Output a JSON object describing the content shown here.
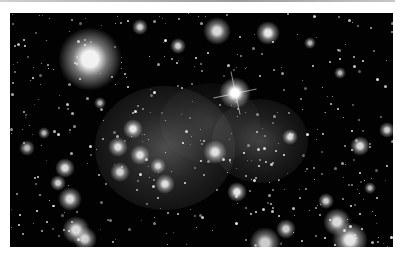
{
  "image": {
    "subject": "deep-field astronomical photograph of a galaxy cluster with diffuse intracluster light",
    "palette": {
      "background": "#020202",
      "page": "#ffffff",
      "rule": "#9a9a9a"
    },
    "glows": [
      {
        "x": 155,
        "y": 135,
        "rx": 70,
        "ry": 62,
        "a": 0.38
      },
      {
        "x": 250,
        "y": 128,
        "rx": 48,
        "ry": 42,
        "a": 0.32
      },
      {
        "x": 200,
        "y": 110,
        "rx": 50,
        "ry": 40,
        "a": 0.18
      }
    ],
    "bright_objects": [
      {
        "x": 80,
        "y": 46,
        "r": 16,
        "a": 0.95
      },
      {
        "x": 225,
        "y": 80,
        "r": 8,
        "a": 1.0,
        "spikes": true
      },
      {
        "x": 207,
        "y": 18,
        "r": 7,
        "a": 0.85
      },
      {
        "x": 258,
        "y": 20,
        "r": 6,
        "a": 0.9
      },
      {
        "x": 168,
        "y": 33,
        "r": 4,
        "a": 0.8
      },
      {
        "x": 130,
        "y": 14,
        "r": 4,
        "a": 0.8
      },
      {
        "x": 205,
        "y": 139,
        "r": 6,
        "a": 0.85
      },
      {
        "x": 123,
        "y": 116,
        "r": 5,
        "a": 0.9
      },
      {
        "x": 130,
        "y": 142,
        "r": 5,
        "a": 0.85
      },
      {
        "x": 108,
        "y": 134,
        "r": 5,
        "a": 0.85
      },
      {
        "x": 148,
        "y": 153,
        "r": 4,
        "a": 0.8
      },
      {
        "x": 155,
        "y": 171,
        "r": 5,
        "a": 0.85
      },
      {
        "x": 110,
        "y": 159,
        "r": 5,
        "a": 0.8
      },
      {
        "x": 55,
        "y": 155,
        "r": 5,
        "a": 0.85
      },
      {
        "x": 48,
        "y": 170,
        "r": 4,
        "a": 0.8
      },
      {
        "x": 60,
        "y": 186,
        "r": 6,
        "a": 0.85
      },
      {
        "x": 66,
        "y": 217,
        "r": 7,
        "a": 0.85
      },
      {
        "x": 75,
        "y": 226,
        "r": 6,
        "a": 0.8
      },
      {
        "x": 227,
        "y": 179,
        "r": 5,
        "a": 0.9
      },
      {
        "x": 255,
        "y": 230,
        "r": 8,
        "a": 0.8
      },
      {
        "x": 276,
        "y": 216,
        "r": 5,
        "a": 0.8
      },
      {
        "x": 327,
        "y": 209,
        "r": 7,
        "a": 0.85
      },
      {
        "x": 340,
        "y": 227,
        "r": 9,
        "a": 0.9
      },
      {
        "x": 316,
        "y": 188,
        "r": 4,
        "a": 0.8
      },
      {
        "x": 350,
        "y": 133,
        "r": 5,
        "a": 0.85
      },
      {
        "x": 377,
        "y": 117,
        "r": 4,
        "a": 0.8
      },
      {
        "x": 280,
        "y": 124,
        "r": 4,
        "a": 0.85
      },
      {
        "x": 17,
        "y": 135,
        "r": 4,
        "a": 0.7
      },
      {
        "x": 34,
        "y": 120,
        "r": 3,
        "a": 0.7
      },
      {
        "x": 90,
        "y": 90,
        "r": 3,
        "a": 0.7
      },
      {
        "x": 300,
        "y": 30,
        "r": 3,
        "a": 0.7
      },
      {
        "x": 330,
        "y": 60,
        "r": 3,
        "a": 0.7
      },
      {
        "x": 360,
        "y": 175,
        "r": 3,
        "a": 0.7
      }
    ],
    "faint_star_count": 420,
    "faint_star_seed": 7
  }
}
